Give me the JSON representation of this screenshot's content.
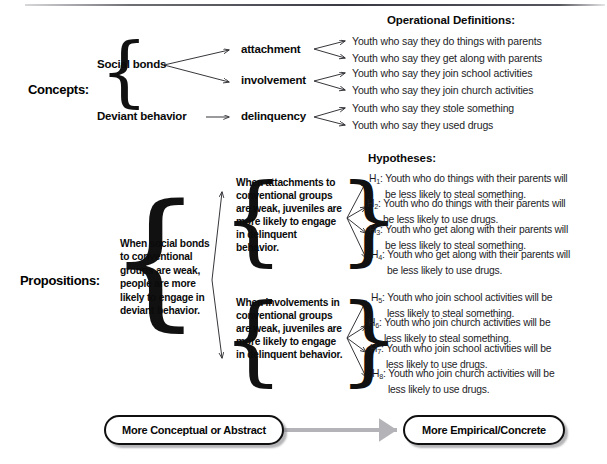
{
  "diagram": {
    "title_rule": true,
    "sections": {
      "concepts_label": "Concepts:",
      "propositions_label": "Propositions:"
    },
    "headers": {
      "operational_definitions": "Operational Definitions:",
      "hypotheses": "Hypotheses:"
    },
    "concepts": {
      "level1": [
        {
          "label": "Social bonds"
        },
        {
          "label": "Deviant behavior"
        }
      ],
      "level2": [
        {
          "label": "attachment"
        },
        {
          "label": "involvement"
        },
        {
          "label": "delinquency"
        }
      ]
    },
    "operational_definitions": [
      "Youth who say they do things with parents",
      "Youth who say they get along with parents",
      "Youth who say they join school activities",
      "Youth who say they join church activities",
      "Youth who say they stole something",
      "Youth who say they used drugs"
    ],
    "propositions": {
      "main": "When social bonds to conventional groups are weak, people are more likely to engage in deviant behavior.",
      "sub": [
        "When attachments to conventional groups are weak, juveniles are more likely to engage in delinquent behavior.",
        "When involvements in conventional groups are weak, juveniles are more likely to engage in delinquent behavior."
      ]
    },
    "hypotheses": [
      {
        "id": "H",
        "sub": "1",
        "line1": "Youth who do things with their parents will",
        "line2": "be less likely to steal something."
      },
      {
        "id": "H",
        "sub": "2",
        "line1": "Youth who do things with their parents will",
        "line2": "be less likely to use drugs."
      },
      {
        "id": "H",
        "sub": "3",
        "line1": "Youth who get along with their parents will",
        "line2": "be less likely to steal something."
      },
      {
        "id": "H",
        "sub": "4",
        "line1": "Youth who get along with their parents will",
        "line2": "be less likely to use drugs."
      },
      {
        "id": "H",
        "sub": "5",
        "line1": "Youth who join school activities will be",
        "line2": "less likely to steal something."
      },
      {
        "id": "H",
        "sub": "6",
        "line1": "Youth who join church activities will be",
        "line2": "less likely to steal something."
      },
      {
        "id": "H",
        "sub": "7",
        "line1": "Youth who join school activities will be",
        "line2": "less likely to use drugs."
      },
      {
        "id": "H",
        "sub": "8",
        "line1": "Youth who join church activities will be",
        "line2": "less likely to use drugs."
      }
    ],
    "continuum": {
      "left_label": "More Conceptual or Abstract",
      "right_label": "More Empirical/Concrete",
      "arrow": "double-headed-horizontal-arrow",
      "arrow_color": "#b4b4b8"
    },
    "colors": {
      "ink": "#101010",
      "body_text": "#1d1d1f",
      "arrow_line": "#2b2b30",
      "continuum_arrow": "#b4b4b8",
      "background": "#ffffff"
    }
  }
}
